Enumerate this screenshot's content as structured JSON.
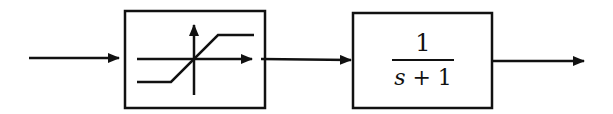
{
  "diagram": {
    "type": "block-diagram",
    "colors": {
      "stroke": "#111111",
      "background": "#ffffff"
    },
    "blocks": [
      {
        "id": "saturation",
        "kind": "saturation-nonlinearity",
        "icon": "saturation-icon"
      },
      {
        "id": "transfer-function",
        "kind": "transfer-function",
        "numerator": "1",
        "denominator_var": "s",
        "denominator_op": "+",
        "denominator_const": "1"
      }
    ],
    "connections": [
      {
        "from": "input",
        "to": "saturation"
      },
      {
        "from": "saturation",
        "to": "transfer-function"
      },
      {
        "from": "transfer-function",
        "to": "output"
      }
    ]
  }
}
